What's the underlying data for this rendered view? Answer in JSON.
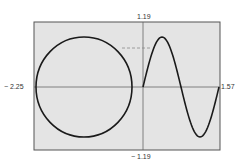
{
  "chart_data": {
    "type": "line",
    "title": "",
    "xlabel": "",
    "ylabel": "",
    "xlim": [
      -2.25,
      1.57
    ],
    "ylim": [
      -1.19,
      1.19
    ],
    "grid": false,
    "legend": null,
    "axis_labels": {
      "x_min": "− 2.25",
      "x_max": "1.57",
      "y_max": "1.19",
      "y_min": "− 1.19"
    },
    "series": [
      {
        "name": "circle",
        "shape": "circle",
        "center": [
          -1.17,
          0
        ],
        "radius": 1.0
      },
      {
        "name": "sine",
        "function": "sin(4x)",
        "x_range": [
          0,
          1.57
        ],
        "points": [
          [
            0,
            0
          ],
          [
            0.39,
            1.0
          ],
          [
            0.785,
            0
          ],
          [
            1.18,
            -1.0
          ],
          [
            1.57,
            0
          ]
        ]
      },
      {
        "name": "dashed-reference",
        "style": "dashed",
        "y": 0.78,
        "x_range": [
          -0.39,
          0.16
        ]
      }
    ]
  },
  "labels": {
    "y_max": "1.19",
    "y_min": "− 1.19",
    "x_min": "− 2.25",
    "x_max": "1.57"
  },
  "colors": {
    "background": "#e4e4e4",
    "frame": "#555555",
    "axis": "#666666",
    "curve": "#1a1a1a",
    "dashed": "#888888"
  }
}
